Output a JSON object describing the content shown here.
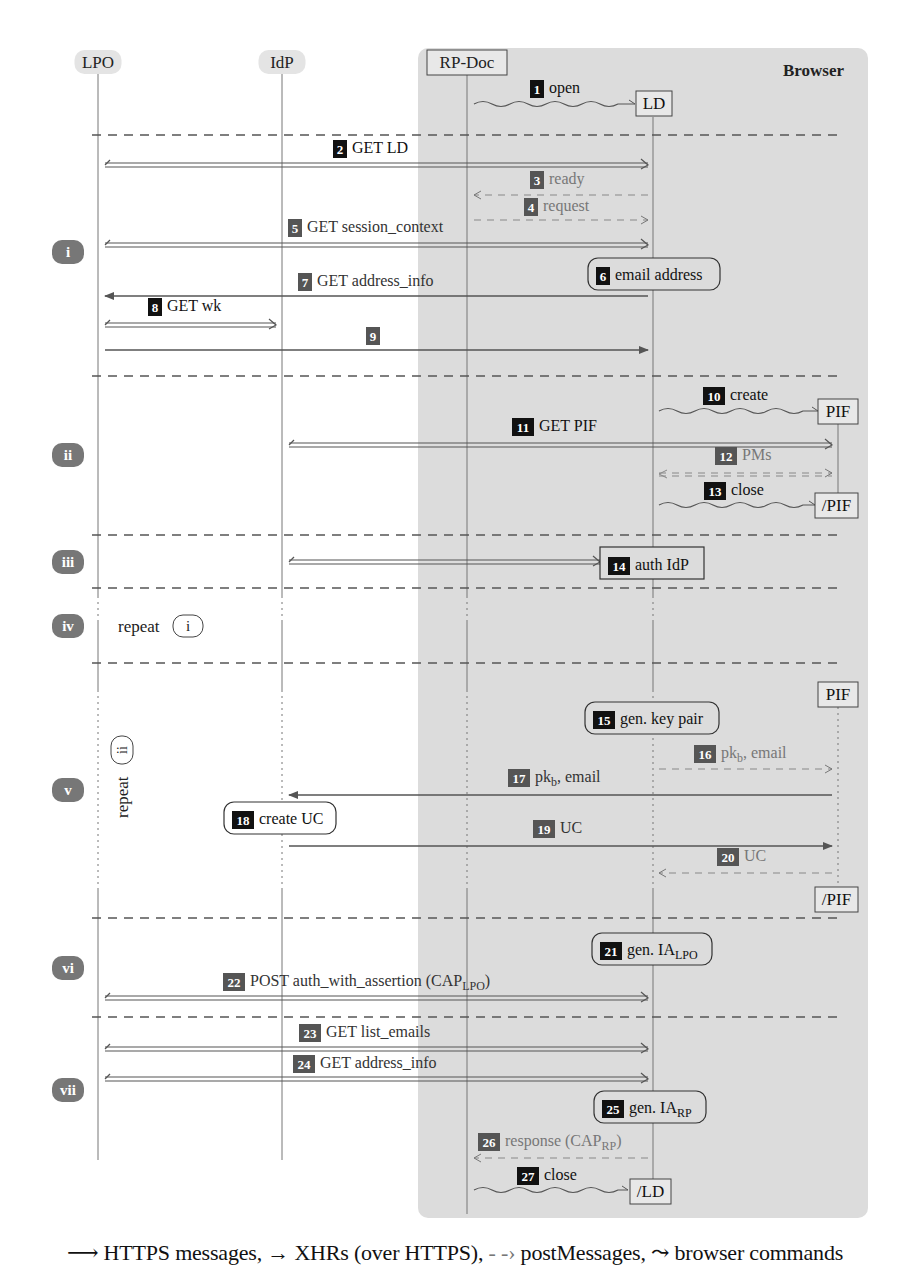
{
  "participants": [
    {
      "id": "lpo",
      "label": "LPO",
      "x": 98,
      "style": "rounded-gray"
    },
    {
      "id": "idp",
      "label": "IdP",
      "x": 282,
      "style": "rounded-gray"
    },
    {
      "id": "rpdoc",
      "label": "RP-Doc",
      "x": 467,
      "style": "boxed"
    },
    {
      "id": "ld",
      "label": "LD",
      "x": 653,
      "style": "boxed"
    },
    {
      "id": "pif",
      "label": "PIF",
      "x": 838,
      "style": "boxed"
    }
  ],
  "browser": {
    "label": "Browser",
    "x": 418,
    "y": 48,
    "w": 450,
    "h": 1170
  },
  "sections": [
    {
      "id": "i",
      "label": "i",
      "y": 252
    },
    {
      "id": "ii",
      "label": "ii",
      "y": 455
    },
    {
      "id": "iii",
      "label": "iii",
      "y": 562
    },
    {
      "id": "iv",
      "label": "iv",
      "y": 626
    },
    {
      "id": "v",
      "label": "v",
      "y": 790
    },
    {
      "id": "vi",
      "label": "vi",
      "y": 968
    },
    {
      "id": "vii",
      "label": "vii",
      "y": 1090
    }
  ],
  "section_dividers": [
    135,
    376,
    535,
    588,
    663,
    918,
    1017
  ],
  "repeats": [
    {
      "text": "repeat",
      "ref": "i",
      "orientation": "horizontal",
      "x": 118,
      "y": 626
    },
    {
      "text": "repeat",
      "ref": "ii",
      "orientation": "vertical",
      "x": 122,
      "y": 790
    }
  ],
  "messages": [
    {
      "n": "1",
      "label": "open",
      "type": "command",
      "from": 474,
      "to": 635,
      "y": 104,
      "badge": "black",
      "lx": 530,
      "ly": 93
    },
    {
      "n": "2",
      "label": "GET LD",
      "type": "https",
      "from": 105,
      "to": 648,
      "y": 165,
      "badge": "black",
      "lx": 333,
      "ly": 153
    },
    {
      "n": "3",
      "label": "ready",
      "type": "post",
      "from": 648,
      "to": 474,
      "y": 195,
      "badge": "gray",
      "lx": 530,
      "ly": 184
    },
    {
      "n": "4",
      "label": "request",
      "type": "post",
      "from": 474,
      "to": 648,
      "y": 220,
      "badge": "gray",
      "lx": 524,
      "ly": 211
    },
    {
      "n": "5",
      "label": "GET session_context",
      "type": "https",
      "from": 105,
      "to": 648,
      "y": 245,
      "badge": "gray",
      "lx": 288,
      "ly": 232
    },
    {
      "n": "7",
      "label": "GET address_info",
      "type": "xhr",
      "from": 648,
      "to": 105,
      "y": 296,
      "badge": "gray",
      "lx": 298,
      "ly": 286
    },
    {
      "n": "8",
      "label": "GET wk",
      "type": "https",
      "from": 105,
      "to": 276,
      "y": 325,
      "badge": "black",
      "lx": 148,
      "ly": 311
    },
    {
      "n": "9",
      "label": "",
      "type": "xhr",
      "from": 105,
      "to": 648,
      "y": 350,
      "badge": "gray",
      "lx": 366,
      "ly": 340
    },
    {
      "n": "10",
      "label": "create",
      "type": "command",
      "from": 659,
      "to": 818,
      "y": 411,
      "badge": "black",
      "lx": 703,
      "ly": 400
    },
    {
      "n": "11",
      "label": "GET PIF",
      "type": "https",
      "from": 289,
      "to": 832,
      "y": 445,
      "badge": "black",
      "lx": 512,
      "ly": 431
    },
    {
      "n": "12",
      "label": "PMs",
      "type": "post-both",
      "from": 659,
      "to": 832,
      "y": 473,
      "badge": "gray",
      "lx": 715,
      "ly": 460
    },
    {
      "n": "13",
      "label": "close",
      "type": "command",
      "from": 659,
      "to": 815,
      "y": 505,
      "badge": "black",
      "lx": 704,
      "ly": 495
    },
    {
      "n": "14",
      "label": "auth IdP",
      "type": "https",
      "from": 289,
      "to": 600,
      "y": 562,
      "badge": "black",
      "lx": 608,
      "ly": 562
    },
    {
      "n": "16",
      "label": "pkb, email",
      "type": "post",
      "from": 659,
      "to": 832,
      "y": 769,
      "badge": "gray",
      "lx": 694,
      "ly": 758
    },
    {
      "n": "17",
      "label": "pkb, email",
      "type": "xhr",
      "from": 832,
      "to": 289,
      "y": 795,
      "badge": "gray",
      "lx": 508,
      "ly": 782
    },
    {
      "n": "19",
      "label": "UC",
      "type": "xhr",
      "from": 289,
      "to": 832,
      "y": 846,
      "badge": "gray",
      "lx": 533,
      "ly": 833
    },
    {
      "n": "20",
      "label": "UC",
      "type": "post",
      "from": 832,
      "to": 659,
      "y": 873,
      "badge": "gray",
      "lx": 717,
      "ly": 861
    },
    {
      "n": "22",
      "label": "POST auth_with_assertion (CAPLPO)",
      "type": "https",
      "from": 105,
      "to": 648,
      "y": 998,
      "badge": "gray",
      "lx": 223,
      "ly": 986
    },
    {
      "n": "23",
      "label": "GET list_emails",
      "type": "https",
      "from": 105,
      "to": 648,
      "y": 1049,
      "badge": "gray",
      "lx": 299,
      "ly": 1037
    },
    {
      "n": "24",
      "label": "GET address_info",
      "type": "https",
      "from": 105,
      "to": 648,
      "y": 1079,
      "badge": "gray",
      "lx": 293,
      "ly": 1068
    },
    {
      "n": "26",
      "label": "response (CAPRP)",
      "type": "post",
      "from": 648,
      "to": 474,
      "y": 1158,
      "badge": "gray",
      "lx": 478,
      "ly": 1146
    },
    {
      "n": "27",
      "label": "close",
      "type": "command",
      "from": 474,
      "to": 628,
      "y": 1190,
      "badge": "black",
      "lx": 517,
      "ly": 1180
    }
  ],
  "actions": [
    {
      "n": "6",
      "label": "email address",
      "x": 588,
      "y": 258,
      "w": 132,
      "h": 32,
      "rounded": true
    },
    {
      "n": "15",
      "label": "gen. key pair",
      "x": 585,
      "y": 702,
      "w": 134,
      "h": 32,
      "rounded": true
    },
    {
      "n": "18",
      "label": "create UC",
      "x": 224,
      "y": 802,
      "w": 112,
      "h": 32,
      "rounded": true
    },
    {
      "n": "21",
      "label": "gen. IA",
      "sub": "LPO",
      "x": 592,
      "y": 933,
      "w": 120,
      "h": 32,
      "rounded": true
    },
    {
      "n": "25",
      "label": "gen. IA",
      "sub": "RP",
      "x": 594,
      "y": 1091,
      "w": 112,
      "h": 32,
      "rounded": true
    },
    {
      "n": "14b",
      "label": "",
      "x": 600,
      "y": 547,
      "w": 104,
      "h": 32,
      "rounded": false
    }
  ],
  "frame_boxes": [
    {
      "label": "LD",
      "x": 636,
      "y": 91,
      "w": 36,
      "h": 25
    },
    {
      "label": "PIF",
      "x": 818,
      "y": 399,
      "w": 40,
      "h": 25
    },
    {
      "label": "/PIF",
      "x": 815,
      "y": 493,
      "w": 43,
      "h": 25
    },
    {
      "label": "PIF",
      "x": 818,
      "y": 682,
      "w": 40,
      "h": 25
    },
    {
      "label": "/PIF",
      "x": 815,
      "y": 887,
      "w": 43,
      "h": 25
    },
    {
      "label": "/LD",
      "x": 630,
      "y": 1179,
      "w": 41,
      "h": 25
    }
  ],
  "legend": {
    "https": "HTTPS messages,",
    "xhr": "XHRs (over HTTPS),",
    "post": "postMessages,",
    "command": "browser commands"
  },
  "colors": {
    "browser_bg": "#dcdcdc",
    "badge_black": "#111111",
    "badge_gray": "#555555",
    "line": "#555555",
    "section_badge": "#777777",
    "post_text": "#777777"
  }
}
